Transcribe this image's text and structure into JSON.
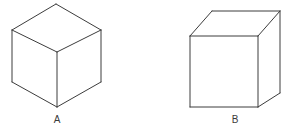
{
  "figure": {
    "background_color": "#ffffff",
    "stroke_color": "#3c3c3c",
    "face_fill_color": "#ffffff",
    "stroke_width": 1,
    "width": 291,
    "height": 133,
    "shapes": [
      {
        "id": "cube-a",
        "label": "A",
        "name": "isometric-cube",
        "description": "Cube drawn in isometric projection, viewed corner-on, with three visible rhombus faces",
        "label_position": {
          "x": 57,
          "y": 120
        },
        "vertices": {
          "top": {
            "x": 56,
            "y": 4
          },
          "left_upper": {
            "x": 12,
            "y": 30
          },
          "right_upper": {
            "x": 101,
            "y": 30
          },
          "center": {
            "x": 57,
            "y": 52
          },
          "left_lower": {
            "x": 12,
            "y": 82
          },
          "right_lower": {
            "x": 101,
            "y": 82
          },
          "bottom": {
            "x": 57,
            "y": 107
          }
        },
        "faces": [
          {
            "name": "top-face",
            "points": "56,4 12,30 57,52 101,30"
          },
          {
            "name": "left-face",
            "points": "12,30 12,82 57,107 57,52"
          },
          {
            "name": "right-face",
            "points": "57,52 57,107 101,82 101,30"
          }
        ],
        "edges": [
          {
            "name": "top-left-edge",
            "points": "56,4 12,30"
          },
          {
            "name": "top-right-edge",
            "points": "56,4 101,30"
          },
          {
            "name": "center-left-edge",
            "points": "12,30 57,52"
          },
          {
            "name": "center-right-edge",
            "points": "101,30 57,52"
          },
          {
            "name": "left-vertical-edge",
            "points": "12,30 12,82"
          },
          {
            "name": "right-vertical-edge",
            "points": "101,30 101,82"
          },
          {
            "name": "center-vertical-edge",
            "points": "57,52 57,107"
          },
          {
            "name": "bottom-left-edge",
            "points": "12,82 57,107"
          },
          {
            "name": "bottom-right-edge",
            "points": "101,82 57,107"
          }
        ]
      },
      {
        "id": "cube-b",
        "label": "B",
        "name": "perspective-cube",
        "description": "Cube drawn in oblique projection, viewed face-on, with square front face plus top and right faces receding",
        "label_position": {
          "x": 235,
          "y": 120
        },
        "vertices": {
          "front_top_left": {
            "x": 190,
            "y": 36
          },
          "front_top_right": {
            "x": 258,
            "y": 36
          },
          "front_bottom_left": {
            "x": 190,
            "y": 107
          },
          "front_bottom_right": {
            "x": 258,
            "y": 107
          },
          "back_top_left": {
            "x": 212,
            "y": 11
          },
          "back_top_right": {
            "x": 280,
            "y": 11
          },
          "back_bottom_right": {
            "x": 280,
            "y": 93
          }
        },
        "faces": [
          {
            "name": "front-face",
            "points": "190,36 258,36 258,107 190,107"
          },
          {
            "name": "top-face",
            "points": "190,36 212,11 280,11 258,36"
          },
          {
            "name": "right-face",
            "points": "258,36 280,11 280,93 258,107"
          }
        ],
        "edges": [
          {
            "name": "front-top-edge",
            "points": "190,36 258,36"
          },
          {
            "name": "front-left-edge",
            "points": "190,36 190,107"
          },
          {
            "name": "front-right-edge",
            "points": "258,36 258,107"
          },
          {
            "name": "front-bottom-edge",
            "points": "190,107 258,107"
          },
          {
            "name": "top-left-receding-edge",
            "points": "190,36 212,11"
          },
          {
            "name": "top-right-receding-edge",
            "points": "258,36 280,11"
          },
          {
            "name": "back-top-edge",
            "points": "212,11 280,11"
          },
          {
            "name": "back-right-vertical-edge",
            "points": "280,11 280,93"
          },
          {
            "name": "bottom-right-receding-edge",
            "points": "258,107 280,93"
          }
        ]
      }
    ]
  }
}
